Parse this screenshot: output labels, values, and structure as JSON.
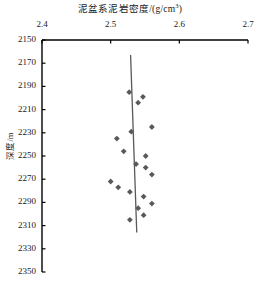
{
  "chart_data": {
    "type": "scatter",
    "title_main": "泥盆系泥岩密度/(g/cm",
    "title_sup": "3",
    "title_tail": ")",
    "xlabel": "泥盆系泥岩密度/(g/cm³)",
    "ylabel": "深度/m",
    "xlabel_position": "top",
    "grid": false,
    "legend": false,
    "xlim": [
      2.4,
      2.7
    ],
    "ylim": [
      2150,
      2350
    ],
    "y_inverted": true,
    "xticks": [
      "2.4",
      "2.5",
      "2.6",
      "2.7"
    ],
    "xtick_values": [
      2.4,
      2.5,
      2.6,
      2.7
    ],
    "yticks": [
      "2150",
      "2170",
      "2190",
      "2210",
      "2230",
      "2250",
      "2270",
      "2290",
      "2310",
      "2330",
      "2350"
    ],
    "ytick_values": [
      2150,
      2170,
      2190,
      2210,
      2230,
      2250,
      2270,
      2290,
      2310,
      2330,
      2350
    ],
    "marker": "diamond",
    "marker_color": "#595959",
    "line_color": "#595959",
    "axis_color": "#000000",
    "series": [
      {
        "name": "泥岩密度样点",
        "x": [
          2.527,
          2.547,
          2.54,
          2.56,
          2.53,
          2.509,
          2.519,
          2.551,
          2.537,
          2.551,
          2.56,
          2.5,
          2.511,
          2.528,
          2.548,
          2.56,
          2.54,
          2.548,
          2.528
        ],
        "y": [
          2195,
          2199,
          2204,
          2225,
          2229,
          2235,
          2246,
          2250,
          2257,
          2260,
          2266,
          2272,
          2277,
          2281,
          2285,
          2291,
          2295,
          2301,
          2305
        ]
      }
    ],
    "trendline": {
      "name": "拟合趋势线",
      "x": [
        2.529,
        2.538
      ],
      "y": [
        2163,
        2316
      ]
    }
  }
}
